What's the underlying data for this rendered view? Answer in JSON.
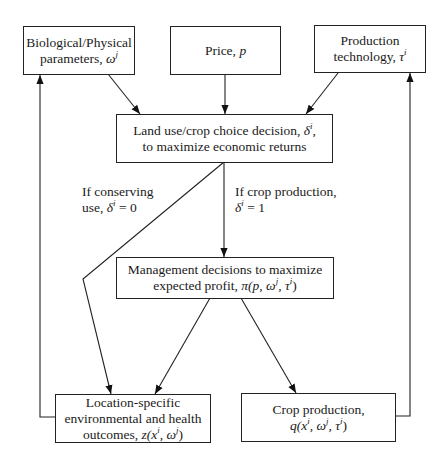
{
  "nodes": {
    "bio": {
      "line1": "Biological/Physical",
      "line2": "parameters, ",
      "sym": "ω",
      "sup": "j"
    },
    "price": {
      "line1": "Price, ",
      "sym": "p"
    },
    "tech": {
      "line1": "Production",
      "line2": "technology, ",
      "sym": "τ",
      "sup": "i"
    },
    "landuse": {
      "line1": "Land use/crop choice decision, ",
      "sym": "δ",
      "sup": "i",
      "tail": ",",
      "line2": "to maximize economic returns"
    },
    "mgmt": {
      "line1": "Management decisions to maximize",
      "line2": "expected profit, ",
      "formula": "π(p, ω",
      "sup1": "j",
      "mid": ", τ",
      "sup2": "i",
      "end": ")"
    },
    "env": {
      "line1": "Location-specific",
      "line2": "environmental and health",
      "line3": "outcomes, ",
      "formula": "z(x",
      "sup1": "i",
      "mid": ", ω",
      "sup2": "j",
      "end": ")"
    },
    "crop": {
      "line1": "Crop production,",
      "formula": "q(x",
      "sup1": "i",
      "mid": ", ω",
      "sup2": "j",
      "mid2": ", τ",
      "sup3": "i",
      "end": ")"
    }
  },
  "edge_labels": {
    "conserve": {
      "line1": "If conserving",
      "line2": "use, ",
      "sym": "δ",
      "sup": "i",
      "eq": " = 0"
    },
    "crop": {
      "line1": "If crop production,",
      "sym": "δ",
      "sup": "i",
      "eq": " = 1"
    }
  }
}
